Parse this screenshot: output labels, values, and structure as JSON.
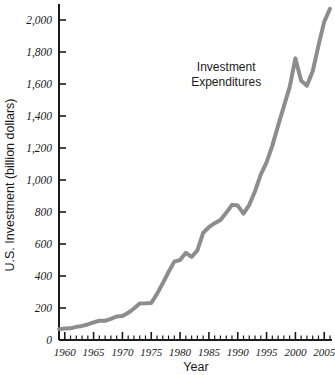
{
  "chart_data": {
    "type": "line",
    "title": "",
    "xlabel": "Year",
    "ylabel": "U.S. Investment (billion dollars)",
    "xlim": [
      1959,
      2006
    ],
    "ylim": [
      0,
      2000
    ],
    "grid": false,
    "legend_position": "none",
    "x_tick_labels": [
      "1960",
      "1965",
      "1970",
      "1975",
      "1980",
      "1985",
      "1990",
      "1995",
      "2000",
      "2005"
    ],
    "x_tick_values": [
      1960,
      1965,
      1970,
      1975,
      1980,
      1985,
      1990,
      1995,
      2000,
      2005
    ],
    "x_minor_tick_step": 1,
    "y_tick_labels": [
      "0",
      "200",
      "400",
      "600",
      "800",
      "1,000",
      "1,200",
      "1,400",
      "1,600",
      "1,800",
      "2,000"
    ],
    "y_tick_values": [
      0,
      200,
      400,
      600,
      800,
      1000,
      1200,
      1400,
      1600,
      1800,
      2000
    ],
    "annotations": [
      {
        "name": "series-annotation",
        "line1": "Investment",
        "line2": "Expenditures",
        "x": 1988,
        "y": 1680
      }
    ],
    "series": [
      {
        "name": "Investment Expenditures",
        "color": "#8d8d8d",
        "line_width": 4,
        "x": [
          1959,
          1960,
          1961,
          1962,
          1963,
          1964,
          1965,
          1966,
          1967,
          1968,
          1969,
          1970,
          1971,
          1972,
          1973,
          1974,
          1975,
          1976,
          1977,
          1978,
          1979,
          1980,
          1981,
          1982,
          1983,
          1984,
          1985,
          1986,
          1987,
          1988,
          1989,
          1990,
          1991,
          1992,
          1993,
          1994,
          1995,
          1996,
          1997,
          1998,
          1999,
          2000,
          2001,
          2002,
          2003,
          2004,
          2005,
          2006
        ],
        "values": [
          68,
          72,
          73,
          82,
          88,
          97,
          110,
          120,
          120,
          132,
          147,
          150,
          170,
          197,
          228,
          229,
          231,
          288,
          355,
          425,
          490,
          500,
          545,
          520,
          560,
          670,
          705,
          730,
          750,
          795,
          845,
          840,
          790,
          845,
          930,
          1035,
          1110,
          1215,
          1340,
          1460,
          1580,
          1760,
          1620,
          1590,
          1680,
          1840,
          1990,
          2070
        ]
      }
    ]
  },
  "axis_colors": {
    "axis_line": "#1a1a1a",
    "series_line": "#8d8d8d",
    "background": "#ffffff"
  }
}
